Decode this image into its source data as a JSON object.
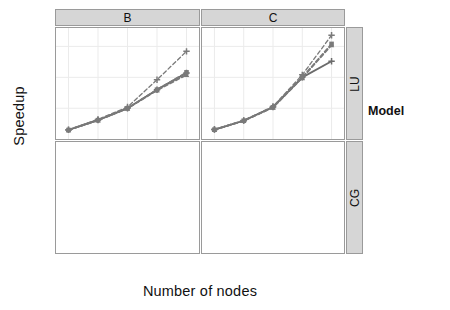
{
  "chart_data": {
    "type": "line",
    "title": "",
    "xlabel": "Number of nodes",
    "ylabel": "Speedup",
    "xscale": "log2",
    "x": [
      8,
      16,
      32,
      64,
      128
    ],
    "xtick_labels": [
      "8",
      "16",
      "32",
      "64",
      "128"
    ],
    "grid": true,
    "legend_position": "right",
    "legend_title": "Model",
    "facet_cols": [
      "B",
      "C"
    ],
    "facet_rows": [
      "LU",
      "CG"
    ],
    "facets": [
      {
        "col": "B",
        "row": "LU",
        "ylim": [
          5,
          85
        ],
        "ytick_labels": [
          "25",
          "50",
          "75"
        ],
        "yticks": [
          25,
          50,
          75
        ],
        "series": [
          {
            "name": "Real",
            "values": [
              7.5,
              15.5,
              25.0,
              40.0,
              53.5
            ]
          },
          {
            "name": "Hybrid",
            "values": [
              7.3,
              15.3,
              24.8,
              39.5,
              52.0
            ]
          },
          {
            "name": "LogGPS",
            "values": [
              7.4,
              15.4,
              25.0,
              40.0,
              54.0
            ]
          },
          {
            "name": "Fluid",
            "values": [
              7.6,
              16.0,
              26.0,
              48.0,
              71.0
            ]
          }
        ]
      },
      {
        "col": "C",
        "row": "LU",
        "ylim": [
          5,
          85
        ],
        "ytick_labels": [
          "25",
          "50",
          "75"
        ],
        "yticks": [
          25,
          50,
          75
        ],
        "series": [
          {
            "name": "Real",
            "values": [
              7.8,
              15.0,
              26.0,
              50.0,
              63.0
            ]
          },
          {
            "name": "Hybrid",
            "values": [
              7.6,
              14.8,
              25.6,
              49.5,
              76.0
            ]
          },
          {
            "name": "LogGPS",
            "values": [
              7.7,
              14.9,
              25.8,
              50.0,
              77.0
            ]
          },
          {
            "name": "Fluid",
            "values": [
              7.9,
              15.2,
              26.4,
              52.0,
              84.0
            ]
          }
        ]
      },
      {
        "col": "B",
        "row": "CG",
        "ylim": [
          7,
          34
        ],
        "ytick_labels": [
          "10",
          "15",
          "20",
          "25",
          "30"
        ],
        "yticks": [
          10,
          15,
          20,
          25,
          30
        ],
        "annotation": {
          "text": "Network collapse",
          "target_x": 128,
          "target_y": 13.2
        },
        "series": [
          {
            "name": "Real",
            "values": [
              8.1,
              10.6,
              12.6,
              13.0,
              13.3
            ]
          },
          {
            "name": "Hybrid",
            "values": [
              8.2,
              10.8,
              15.6,
              18.2,
              22.3
            ]
          },
          {
            "name": "LogGPS",
            "values": [
              8.3,
              10.9,
              15.7,
              18.3,
              22.5
            ]
          },
          {
            "name": "Fluid",
            "values": [
              8.4,
              11.0,
              17.0,
              20.0,
              21.8
            ]
          }
        ]
      },
      {
        "col": "C",
        "row": "CG",
        "ylim": [
          7,
          34
        ],
        "ytick_labels": [
          "10",
          "15",
          "20",
          "25",
          "30"
        ],
        "yticks": [
          10,
          15,
          20,
          25,
          30
        ],
        "series": [
          {
            "name": "Real",
            "values": [
              8.4,
              12.0,
              16.4,
              18.2,
              20.0
            ]
          },
          {
            "name": "Hybrid",
            "values": [
              8.3,
              11.9,
              16.3,
              17.8,
              21.2
            ]
          },
          {
            "name": "LogGPS",
            "values": [
              8.5,
              12.1,
              19.0,
              23.5,
              33.3
            ]
          },
          {
            "name": "Fluid",
            "values": [
              8.4,
              12.0,
              16.6,
              20.5,
              26.5
            ]
          }
        ]
      }
    ],
    "legend_entries": [
      {
        "label": "Real",
        "marker": "plus",
        "dash": "solid"
      },
      {
        "label": "Hybrid",
        "marker": "triangle",
        "dash": "dashed"
      },
      {
        "label": "LogGPS",
        "marker": "square",
        "dash": "dashed"
      },
      {
        "label": "Fluid",
        "marker": "plus",
        "dash": "dashed"
      }
    ]
  },
  "colors": {
    "series_line": "#7a7a7a",
    "series_line_dark": "#6b6b6b",
    "panel_border": "#9a9a9a",
    "strip_bg": "#d6d6d6",
    "grid_major": "#ebebeb",
    "annotation": "#000000",
    "background": "#ffffff"
  },
  "axes": {
    "y_title": "Speedup",
    "x_title": "Number of nodes"
  },
  "legend": {
    "title": "Model"
  },
  "annotations": {
    "network_collapse": "Network collapse"
  }
}
